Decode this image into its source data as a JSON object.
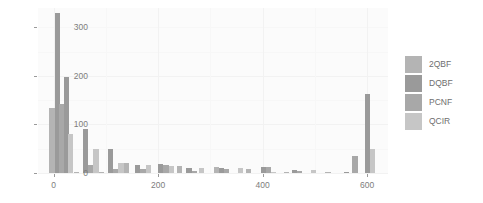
{
  "chart_data": {
    "type": "bar",
    "title": "",
    "subtitle": "",
    "xlabel": "",
    "ylabel": "",
    "xlim": [
      -30,
      640
    ],
    "ylim": [
      0,
      340
    ],
    "grid": true,
    "legend_position": "right",
    "y_ticks": [
      0,
      100,
      200,
      300
    ],
    "y_tick_labels": [
      "0",
      "100",
      "200",
      "300"
    ],
    "x_ticks": [
      0,
      200,
      400,
      600
    ],
    "x_tick_labels": [
      "0",
      "200",
      "400",
      "600"
    ],
    "series": [
      {
        "name": "2QBF",
        "color": "#b4b4b4"
      },
      {
        "name": "DQBF",
        "color": "#9a9a9a"
      },
      {
        "name": "PCNF",
        "color": "#a8a8a8"
      },
      {
        "name": "QCIR",
        "color": "#c6c6c6"
      }
    ],
    "bars": [
      {
        "x": -8,
        "value": 135,
        "series": "2QBF"
      },
      {
        "x": 3,
        "value": 330,
        "series": "DQBF"
      },
      {
        "x": 11,
        "value": 143,
        "series": "PCNF"
      },
      {
        "x": 19,
        "value": 198,
        "series": "DQBF"
      },
      {
        "x": 27,
        "value": 80,
        "series": "QCIR"
      },
      {
        "x": 38,
        "value": 3,
        "series": "2QBF"
      },
      {
        "x": 56,
        "value": 90,
        "series": "DQBF"
      },
      {
        "x": 66,
        "value": 16,
        "series": "PCNF"
      },
      {
        "x": 76,
        "value": 50,
        "series": "QCIR"
      },
      {
        "x": 86,
        "value": 2,
        "series": "2QBF"
      },
      {
        "x": 104,
        "value": 49,
        "series": "DQBF"
      },
      {
        "x": 114,
        "value": 9,
        "series": "PCNF"
      },
      {
        "x": 124,
        "value": 21,
        "series": "QCIR"
      },
      {
        "x": 134,
        "value": 20,
        "series": "2QBF"
      },
      {
        "x": 156,
        "value": 17,
        "series": "DQBF"
      },
      {
        "x": 166,
        "value": 9,
        "series": "PCNF"
      },
      {
        "x": 176,
        "value": 16,
        "series": "QCIR"
      },
      {
        "x": 200,
        "value": 19,
        "series": "DQBF"
      },
      {
        "x": 210,
        "value": 17,
        "series": "PCNF"
      },
      {
        "x": 220,
        "value": 14,
        "series": "QCIR"
      },
      {
        "x": 236,
        "value": 15,
        "series": "2QBF"
      },
      {
        "x": 254,
        "value": 11,
        "series": "DQBF"
      },
      {
        "x": 264,
        "value": 4,
        "series": "PCNF"
      },
      {
        "x": 278,
        "value": 11,
        "series": "QCIR"
      },
      {
        "x": 306,
        "value": 13,
        "series": "2QBF"
      },
      {
        "x": 316,
        "value": 10,
        "series": "DQBF"
      },
      {
        "x": 326,
        "value": 8,
        "series": "PCNF"
      },
      {
        "x": 352,
        "value": 10,
        "series": "QCIR"
      },
      {
        "x": 368,
        "value": 8,
        "series": "2QBF"
      },
      {
        "x": 396,
        "value": 12,
        "series": "DQBF"
      },
      {
        "x": 406,
        "value": 12,
        "series": "PCNF"
      },
      {
        "x": 416,
        "value": 3,
        "series": "QCIR"
      },
      {
        "x": 440,
        "value": 2,
        "series": "2QBF"
      },
      {
        "x": 456,
        "value": 7,
        "series": "DQBF"
      },
      {
        "x": 466,
        "value": 4,
        "series": "PCNF"
      },
      {
        "x": 492,
        "value": 6,
        "series": "QCIR"
      },
      {
        "x": 520,
        "value": 1,
        "series": "2QBF"
      },
      {
        "x": 556,
        "value": 3,
        "series": "DQBF"
      },
      {
        "x": 572,
        "value": 35,
        "series": "PCNF"
      },
      {
        "x": 596,
        "value": 162,
        "series": "DQBF"
      },
      {
        "x": 606,
        "value": 50,
        "series": "QCIR"
      }
    ]
  },
  "legend": {
    "items": [
      {
        "label": "2QBF"
      },
      {
        "label": "DQBF"
      },
      {
        "label": "PCNF"
      },
      {
        "label": "QCIR"
      }
    ]
  }
}
